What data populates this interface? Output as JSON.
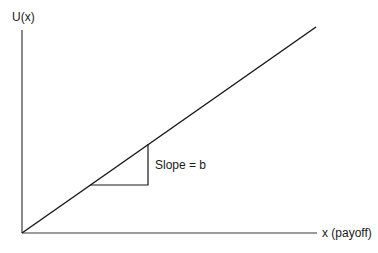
{
  "diagram": {
    "y_axis_label": "U(x)",
    "x_axis_label": "x (payoff)",
    "slope_label": "Slope = b",
    "colors": {
      "line": "#1a1a1a",
      "axis": "#3a3a3a",
      "background": "#ffffff"
    }
  }
}
